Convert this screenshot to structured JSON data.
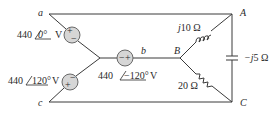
{
  "nodes": {
    "a": "a",
    "b": "b",
    "c": "c",
    "A": "A",
    "B": "B",
    "C": "C"
  },
  "sources": [
    {
      "id": "Va",
      "magnitude": "440",
      "angle": "0°",
      "unit": "V",
      "polarity_top": "+",
      "polarity_bottom": "−"
    },
    {
      "id": "Vb",
      "magnitude": "440",
      "angle": "−120°",
      "unit": "V",
      "polarity_left": "−",
      "polarity_right": "+"
    },
    {
      "id": "Vc",
      "magnitude": "440",
      "angle": "120°",
      "unit": "V",
      "polarity_top": "−",
      "polarity_bottom": "+"
    }
  ],
  "loads": {
    "inductor": {
      "label": "j10 Ω",
      "prefix": "j",
      "value": "10 Ω"
    },
    "resistor": {
      "label": "20 Ω"
    },
    "capacitor": {
      "label": "−j5 Ω",
      "prefix": "−j",
      "value": "5 Ω"
    }
  },
  "colors": {
    "wire": "#3a3a3a",
    "source_fill": "#d6d6d6"
  }
}
